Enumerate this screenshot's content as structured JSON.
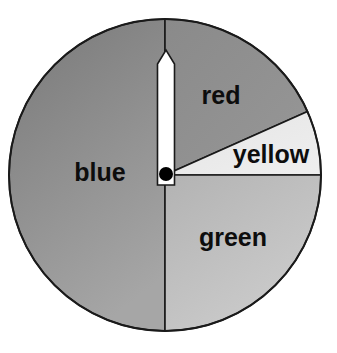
{
  "figure": {
    "kind": "probability-spinner",
    "background_color": "#ffffff",
    "outline_color": "#1a1a1a"
  },
  "spinner": {
    "center_x": 165,
    "center_y": 175,
    "radius": 156,
    "pointer": {
      "label": "spinner-needle",
      "fill_color": "#ffffff",
      "outline_color": "#1a1a1a",
      "pivot_color": "#000000",
      "pivot_radius": 7,
      "angle_degrees": 90,
      "direction": "up"
    },
    "sectors": [
      {
        "name": "blue",
        "label": "blue",
        "start_angle": 90,
        "end_angle": 270,
        "sweep_degrees": 180,
        "fraction": 0.5,
        "fill_color": "#8a8a8a",
        "gradient_from": "#7d7d7d",
        "gradient_to": "#a6a6a6",
        "label_x": 100,
        "label_y": 174,
        "font_size": 25
      },
      {
        "name": "red",
        "label": "red",
        "start_angle": 24,
        "end_angle": 90,
        "sweep_degrees": 66,
        "fraction": 0.1833,
        "fill_color": "#8f8f8f",
        "gradient_from": "#8a8a8a",
        "gradient_to": "#979797",
        "label_x": 221,
        "label_y": 97,
        "font_size": 25
      },
      {
        "name": "yellow",
        "label": "yellow",
        "start_angle": 0,
        "end_angle": 24,
        "sweep_degrees": 24,
        "fraction": 0.0667,
        "fill_color": "#e9e9e9",
        "gradient_from": "#e4e4e4",
        "gradient_to": "#efefef",
        "label_x": 271,
        "label_y": 156,
        "font_size": 25
      },
      {
        "name": "green",
        "label": "green",
        "start_angle": 270,
        "end_angle": 360,
        "sweep_degrees": 90,
        "fraction": 0.25,
        "fill_color": "#bdbdbd",
        "gradient_from": "#b4b4b4",
        "gradient_to": "#cecece",
        "label_x": 233,
        "label_y": 239,
        "font_size": 25
      }
    ]
  }
}
